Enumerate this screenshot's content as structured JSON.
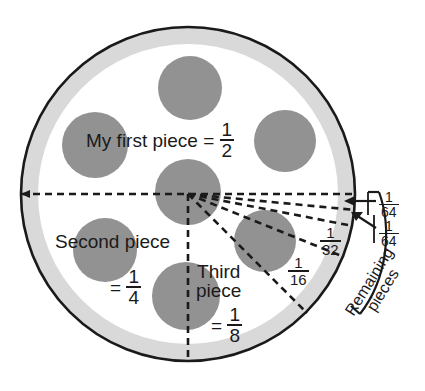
{
  "figure": {
    "type": "diagram"
  },
  "colors": {
    "crust": "#d9d9d9",
    "cheese": "#ffffff",
    "pepperoni": "#929292",
    "outline": "#1a1a1a",
    "text": "#1a1a1a"
  },
  "labels": {
    "first_piece": {
      "text": "My first piece",
      "equals": "=",
      "numerator": "1",
      "denominator": "2"
    },
    "second_piece": {
      "text": "Second piece",
      "equals": "=",
      "numerator": "1",
      "denominator": "4"
    },
    "third_piece": {
      "line1": "Third",
      "line2": "piece",
      "equals": "=",
      "numerator": "1",
      "denominator": "8"
    },
    "sixteenth": {
      "numerator": "1",
      "denominator": "16"
    },
    "thirtysecond": {
      "numerator": "1",
      "denominator": "32"
    },
    "sixtyfourth_upper": {
      "numerator": "1",
      "denominator": "64"
    },
    "sixtyfourth_lower": {
      "numerator": "1",
      "denominator": "64"
    },
    "remaining": {
      "line1": "Remaining",
      "line2": "pieces"
    }
  },
  "geometry": {
    "pizza_center_x": 188,
    "pizza_center_y": 194,
    "pizza_radius": 168,
    "crust_inner_radius": 150,
    "pepperoni": [
      {
        "cx": 190,
        "cy": 88,
        "r": 32
      },
      {
        "cx": 95,
        "cy": 145,
        "r": 33
      },
      {
        "cx": 285,
        "cy": 141,
        "r": 31
      },
      {
        "cx": 188,
        "cy": 192,
        "r": 33
      },
      {
        "cx": 105,
        "cy": 250,
        "r": 32
      },
      {
        "cx": 265,
        "cy": 241,
        "r": 31
      },
      {
        "cx": 186,
        "cy": 296,
        "r": 34
      }
    ],
    "cut_angles_deg": [
      0,
      5.5,
      11,
      22,
      45,
      90
    ]
  }
}
